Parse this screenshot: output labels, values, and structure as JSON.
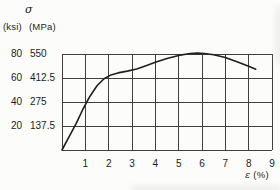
{
  "figure": {
    "y_axis": {
      "symbol": "σ",
      "unit_ksi": "(ksi)",
      "unit_mpa": "(MPa)",
      "ticks_ksi": [
        "80",
        "60",
        "40",
        "20"
      ],
      "ticks_mpa": [
        "550",
        "412.5",
        "275",
        "137.5"
      ]
    },
    "x_axis": {
      "label_symbol": "ε",
      "label_unit": "(%)",
      "ticks": [
        "1",
        "2",
        "3",
        "4",
        "5",
        "6",
        "7",
        "8",
        "9"
      ]
    }
  },
  "chart_data": {
    "type": "line",
    "title": "",
    "xlabel": "ε (%)",
    "ylabel": "σ (ksi) (MPa)",
    "xlim": [
      0,
      9
    ],
    "ylim": [
      0,
      550
    ],
    "grid": true,
    "legend": false,
    "x_ticks": [
      1,
      2,
      3,
      4,
      5,
      6,
      7,
      8,
      9
    ],
    "y_ticks_mpa": [
      137.5,
      275,
      412.5,
      550
    ],
    "y_ticks_ksi": [
      20,
      40,
      60,
      80
    ],
    "series": [
      {
        "name": "stress-strain-curve",
        "units_y": "MPa",
        "x": [
          0,
          0.3,
          0.6,
          0.9,
          1.2,
          1.5,
          1.8,
          2.1,
          2.4,
          2.8,
          3.2,
          3.6,
          4.0,
          4.5,
          5.0,
          5.5,
          5.8,
          6.1,
          6.5,
          7.0,
          7.5,
          8.0,
          8.3
        ],
        "y": [
          0,
          75,
          150,
          235,
          308,
          368,
          408,
          430,
          442,
          452,
          464,
          483,
          503,
          525,
          542,
          553,
          555,
          553,
          546,
          530,
          506,
          480,
          463
        ]
      }
    ]
  },
  "colors": {
    "background": "#fcfcfb",
    "grid": "#3f3f3f",
    "curve": "#1f1f1f",
    "text": "#1c1c1c"
  }
}
